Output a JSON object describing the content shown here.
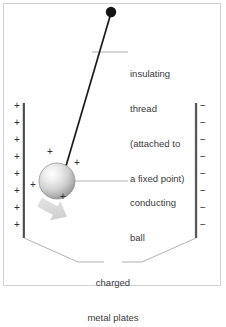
{
  "figure": {
    "background_color": "#ffffff",
    "frame_color": "#d2d2d2",
    "ink_color": "#2e2e2e",
    "leader_color": "#9a9a9a",
    "text_color": "#3a3a3a"
  },
  "labels": {
    "insulating_thread": {
      "line1": "insulating",
      "line2": "thread",
      "line3": "(attached to",
      "line4": "a fixed point)"
    },
    "conducting_ball": {
      "line1": "conducting",
      "line2": "ball"
    },
    "charged_plates": {
      "line1": "charged",
      "line2": "metal plates"
    }
  },
  "elements": {
    "pivot_point": {
      "name": "fixed pivot point",
      "cx": 111,
      "cy": 12,
      "r": 5,
      "color": "#1a1a1a"
    },
    "thread": {
      "name": "insulating thread",
      "x1": 111,
      "y1": 14,
      "x2": 66,
      "y2": 166,
      "color": "#1a1a1a"
    },
    "ball": {
      "name": "conducting ball",
      "cx": 57,
      "cy": 181,
      "r": 18,
      "highlight_color": "#ffffff",
      "mid_color": "#d8d8d8",
      "edge_color": "#8f8f8f"
    },
    "motion_arrow": {
      "name": "force direction arrow",
      "color": "#d5d5d5",
      "direction": "down-right"
    },
    "left_plate": {
      "name": "positively charged plate",
      "x": 24,
      "y_top": 103,
      "y_bottom": 238,
      "charge": "+",
      "charge_count": 8
    },
    "right_plate": {
      "name": "negatively charged plate",
      "x": 196,
      "y_top": 103,
      "y_bottom": 238,
      "charge": "−",
      "charge_count": 8
    }
  },
  "charges": {
    "plate_positive_symbol": "+",
    "plate_negative_symbol": "−",
    "ball_positive_symbol": "+",
    "left_plate_signs": [
      "+",
      "+",
      "+",
      "+",
      "+",
      "+",
      "+",
      "+"
    ],
    "right_plate_signs": [
      "−",
      "−",
      "−",
      "−",
      "−",
      "−",
      "−",
      "−"
    ],
    "ball_signs": [
      "+",
      "+",
      "+",
      "+"
    ]
  },
  "geometry": {
    "left_plate_sign_x": 17,
    "right_plate_sign_x": 202,
    "plate_sign_ys": [
      106,
      123,
      140,
      157,
      174,
      191,
      208,
      225
    ],
    "ball_sign_positions": [
      {
        "x": 50,
        "y": 151
      },
      {
        "x": 77,
        "y": 162
      },
      {
        "x": 33,
        "y": 184
      },
      {
        "x": 63,
        "y": 196
      }
    ]
  }
}
